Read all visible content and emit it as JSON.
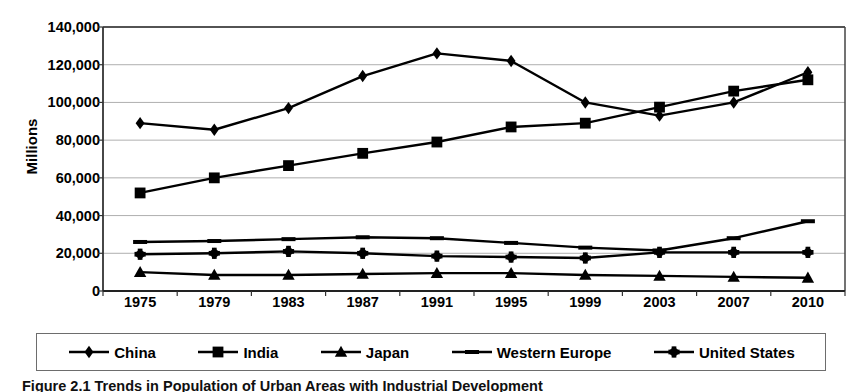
{
  "chart_data": {
    "type": "line",
    "title": "",
    "xlabel": "",
    "ylabel": "Millions",
    "ylim": [
      0,
      140000
    ],
    "ytick_step": 20000,
    "grid": true,
    "legend_position": "bottom",
    "categories": [
      "1975",
      "1979",
      "1983",
      "1987",
      "1991",
      "1995",
      "1999",
      "2003",
      "2007",
      "2010"
    ],
    "ytick_labels": [
      "140,000",
      "120,000",
      "100,000",
      "80,000",
      "60,000",
      "40,000",
      "20,000",
      "0"
    ],
    "ytick_values": [
      140000,
      120000,
      100000,
      80000,
      60000,
      40000,
      20000,
      0
    ],
    "series": [
      {
        "name": "China",
        "marker": "diamond",
        "color": "#000000",
        "values": [
          89000,
          85500,
          97000,
          114000,
          126000,
          122000,
          100000,
          93000,
          100000,
          116000
        ]
      },
      {
        "name": "India",
        "marker": "square",
        "color": "#000000",
        "values": [
          52000,
          60000,
          66500,
          73000,
          79000,
          87000,
          89000,
          97500,
          106000,
          112000
        ]
      },
      {
        "name": "Japan",
        "marker": "triangle",
        "color": "#000000",
        "values": [
          10000,
          8500,
          8500,
          9000,
          9500,
          9500,
          8500,
          8000,
          7500,
          7000
        ]
      },
      {
        "name": "Western Europe",
        "marker": "dash",
        "color": "#000000",
        "values": [
          26000,
          26500,
          27500,
          28500,
          28000,
          25500,
          23000,
          21500,
          28000,
          37000
        ]
      },
      {
        "name": "United States",
        "marker": "star",
        "color": "#000000",
        "values": [
          19500,
          20000,
          21000,
          20000,
          18500,
          18000,
          17500,
          20500,
          20500,
          20500
        ]
      }
    ]
  },
  "legend": {
    "items": [
      {
        "label": "China",
        "marker": "diamond"
      },
      {
        "label": "India",
        "marker": "square"
      },
      {
        "label": "Japan",
        "marker": "triangle"
      },
      {
        "label": "Western Europe",
        "marker": "dash"
      },
      {
        "label": "United States",
        "marker": "star"
      }
    ]
  },
  "caption": {
    "text": "Figure 2.1   Trends in Population of Urban Areas with Industrial Development"
  }
}
